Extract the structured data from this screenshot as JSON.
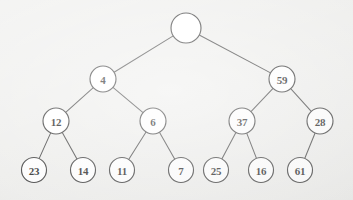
{
  "figure": {
    "kind": "binary-tree-diagram",
    "background_color": "#ededeb",
    "node_fill_color": "#ffffff",
    "node_stroke_color": "#2e2e2e",
    "edge_color": "#3a3a3a",
    "label_color": "#161616",
    "width": 353,
    "height": 200
  },
  "chart_data": {
    "type": "diagram",
    "title": "",
    "nodes": [
      {
        "id": "n0",
        "label": "",
        "x": 186,
        "y": 28,
        "r": 15,
        "level": 0
      },
      {
        "id": "n1",
        "label": "4",
        "x": 103,
        "y": 79,
        "r": 13,
        "level": 1
      },
      {
        "id": "n2",
        "label": "59",
        "x": 282,
        "y": 79,
        "r": 13,
        "level": 1
      },
      {
        "id": "n3",
        "label": "12",
        "x": 56,
        "y": 121,
        "r": 13,
        "level": 2
      },
      {
        "id": "n4",
        "label": "6",
        "x": 153,
        "y": 121,
        "r": 13,
        "level": 2
      },
      {
        "id": "n5",
        "label": "37",
        "x": 242,
        "y": 121,
        "r": 13,
        "level": 2
      },
      {
        "id": "n6",
        "label": "28",
        "x": 320,
        "y": 121,
        "r": 13,
        "level": 2
      },
      {
        "id": "n7",
        "label": "23",
        "x": 34,
        "y": 170,
        "r": 12.5,
        "level": 3
      },
      {
        "id": "n8",
        "label": "14",
        "x": 83,
        "y": 170,
        "r": 12.5,
        "level": 3
      },
      {
        "id": "n9",
        "label": "11",
        "x": 122,
        "y": 170,
        "r": 12.5,
        "level": 3
      },
      {
        "id": "n10",
        "label": "7",
        "x": 181,
        "y": 170,
        "r": 12.5,
        "level": 3
      },
      {
        "id": "n11",
        "label": "25",
        "x": 216,
        "y": 170,
        "r": 12.5,
        "level": 3
      },
      {
        "id": "n12",
        "label": "16",
        "x": 261,
        "y": 170,
        "r": 12.5,
        "level": 3
      },
      {
        "id": "n13",
        "label": "61",
        "x": 300,
        "y": 170,
        "r": 12.5,
        "level": 3
      }
    ],
    "edges": [
      {
        "from": "n0",
        "to": "n1"
      },
      {
        "from": "n0",
        "to": "n2"
      },
      {
        "from": "n1",
        "to": "n3"
      },
      {
        "from": "n1",
        "to": "n4"
      },
      {
        "from": "n2",
        "to": "n5"
      },
      {
        "from": "n2",
        "to": "n6"
      },
      {
        "from": "n3",
        "to": "n7"
      },
      {
        "from": "n3",
        "to": "n8"
      },
      {
        "from": "n4",
        "to": "n9"
      },
      {
        "from": "n4",
        "to": "n10"
      },
      {
        "from": "n5",
        "to": "n11"
      },
      {
        "from": "n5",
        "to": "n12"
      },
      {
        "from": "n6",
        "to": "n13"
      }
    ]
  }
}
